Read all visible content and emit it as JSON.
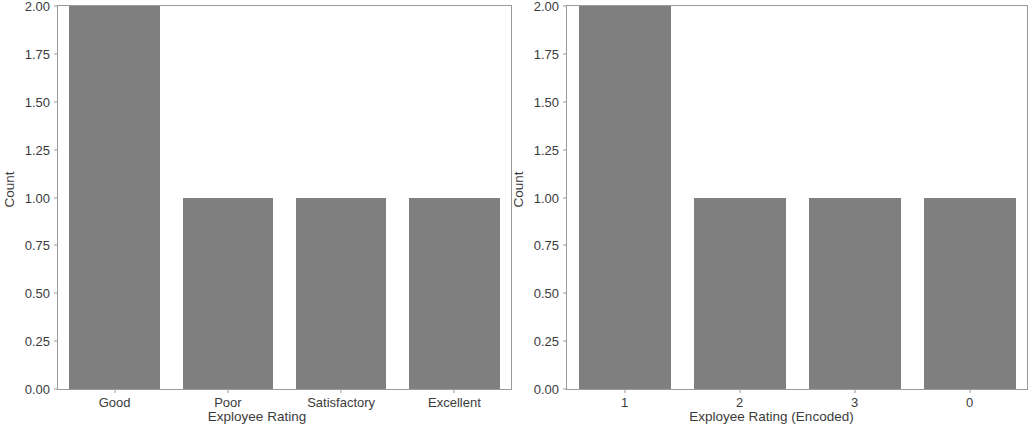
{
  "figure": {
    "background_color": "#ffffff",
    "bar_color": "#7f7f7f",
    "axis_color": "#9a9a9a",
    "text_color": "#3b3b3b"
  },
  "chart_data": [
    {
      "type": "bar",
      "title": "",
      "xlabel": "Exployee Rating",
      "ylabel": "Count",
      "categories": [
        "Good",
        "Poor",
        "Satisfactory",
        "Excellent"
      ],
      "values": [
        2,
        1,
        1,
        1
      ],
      "ylim": [
        0,
        2.0
      ],
      "yticks": [
        "0.00",
        "0.25",
        "0.50",
        "0.75",
        "1.00",
        "1.25",
        "1.50",
        "1.75",
        "2.00"
      ],
      "ytick_values": [
        0,
        0.25,
        0.5,
        0.75,
        1.0,
        1.25,
        1.5,
        1.75,
        2.0
      ],
      "grid": false,
      "legend": false,
      "bar_color": "#7f7f7f"
    },
    {
      "type": "bar",
      "title": "",
      "xlabel": "Exployee Rating (Encoded)",
      "ylabel": "Count",
      "categories": [
        "1",
        "2",
        "3",
        "0"
      ],
      "values": [
        2,
        1,
        1,
        1
      ],
      "ylim": [
        0,
        2.0
      ],
      "yticks": [
        "0.00",
        "0.25",
        "0.50",
        "0.75",
        "1.00",
        "1.25",
        "1.50",
        "1.75",
        "2.00"
      ],
      "ytick_values": [
        0,
        0.25,
        0.5,
        0.75,
        1.0,
        1.25,
        1.5,
        1.75,
        2.0
      ],
      "grid": false,
      "legend": false,
      "bar_color": "#7f7f7f"
    }
  ]
}
